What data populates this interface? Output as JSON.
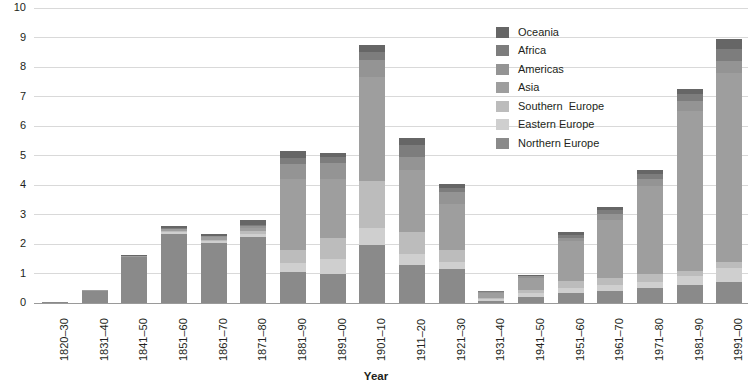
{
  "chart_data": {
    "type": "bar",
    "subtype": "stacked-bar",
    "title": "",
    "xlabel": "Year",
    "ylabel": "",
    "ylim": [
      0,
      10
    ],
    "ytick_step": 1,
    "yticks": [
      "10",
      "9",
      "8",
      "7",
      "6",
      "5",
      "4",
      "3",
      "2",
      "1",
      "0"
    ],
    "grid": true,
    "legend_position": "top-center-right",
    "categories": [
      "1820–30",
      "1831–40",
      "1841–50",
      "1851–60",
      "1861–70",
      "1871–80",
      "1881–90",
      "1891–00",
      "1901–10",
      "1911–20",
      "1921–30",
      "1931–40",
      "1941–50",
      "1951–60",
      "1961–70",
      "1971–80",
      "1981–90",
      "1991–00"
    ],
    "series": [
      {
        "name": "Northern Europe",
        "color": "#8a8a8a",
        "values": [
          0.05,
          0.42,
          1.55,
          2.35,
          2.05,
          2.25,
          1.05,
          1.0,
          1.95,
          1.3,
          1.15,
          0.08,
          0.22,
          0.35,
          0.4,
          0.5,
          0.6,
          0.7
        ]
      },
      {
        "name": "Eastern Europe",
        "color": "#cfcfcf",
        "values": [
          0.0,
          0.0,
          0.0,
          0.05,
          0.05,
          0.1,
          0.3,
          0.5,
          0.6,
          0.35,
          0.25,
          0.04,
          0.12,
          0.15,
          0.2,
          0.22,
          0.3,
          0.5
        ]
      },
      {
        "name": "Southern Europe",
        "color": "#bcbcbc",
        "values": [
          0.0,
          0.0,
          0.02,
          0.05,
          0.05,
          0.1,
          0.45,
          0.7,
          1.6,
          0.75,
          0.4,
          0.05,
          0.1,
          0.25,
          0.25,
          0.25,
          0.2,
          0.2
        ]
      },
      {
        "name": "Asia",
        "color": "#9e9e9e",
        "values": [
          0.0,
          0.01,
          0.02,
          0.05,
          0.1,
          0.1,
          2.4,
          2.0,
          3.5,
          2.1,
          1.55,
          0.18,
          0.4,
          1.35,
          1.95,
          3.0,
          5.4,
          6.4
        ]
      },
      {
        "name": "Americas",
        "color": "#949494",
        "values": [
          0.0,
          0.0,
          0.01,
          0.02,
          0.02,
          0.05,
          0.5,
          0.55,
          0.6,
          0.45,
          0.4,
          0.03,
          0.06,
          0.12,
          0.22,
          0.25,
          0.35,
          0.4
        ]
      },
      {
        "name": "Africa",
        "color": "#7d7d7d",
        "values": [
          0.0,
          0.0,
          0.01,
          0.02,
          0.02,
          0.04,
          0.2,
          0.2,
          0.25,
          0.4,
          0.15,
          0.02,
          0.03,
          0.1,
          0.12,
          0.15,
          0.25,
          0.4
        ]
      },
      {
        "name": "Oceania",
        "color": "#666666",
        "values": [
          0.0,
          0.0,
          0.03,
          0.06,
          0.06,
          0.16,
          0.25,
          0.15,
          0.25,
          0.25,
          0.15,
          0.02,
          0.02,
          0.08,
          0.11,
          0.13,
          0.15,
          0.35
        ]
      }
    ],
    "totals": [
      0.05,
      0.43,
      1.64,
      2.6,
      2.35,
      2.8,
      5.15,
      5.1,
      8.75,
      5.6,
      4.05,
      0.42,
      0.95,
      2.4,
      3.25,
      4.5,
      7.25,
      8.95
    ]
  },
  "legend": {
    "entries": [
      {
        "label": "Oceania",
        "color": "#666666"
      },
      {
        "label": "Africa",
        "color": "#7d7d7d"
      },
      {
        "label": "Americas",
        "color": "#949494"
      },
      {
        "label": "Asia",
        "color": "#9e9e9e"
      },
      {
        "label": "Southern  Europe",
        "color": "#bcbcbc"
      },
      {
        "label": "Eastern Europe",
        "color": "#cfcfcf"
      },
      {
        "label": "Northern Europe",
        "color": "#8a8a8a"
      }
    ]
  },
  "axis": {
    "x_title": "Year"
  },
  "colors": {
    "gridline": "#d9d9d9",
    "baseline": "#9a9a9a",
    "text": "#231f20",
    "background": "#ffffff"
  }
}
